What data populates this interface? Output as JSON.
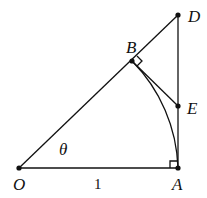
{
  "diagram": {
    "points": {
      "O": {
        "label": "O",
        "x": 19,
        "y": 168
      },
      "A": {
        "label": "A",
        "x": 178,
        "y": 168
      },
      "B": {
        "label": "B",
        "x": 132,
        "y": 61
      },
      "D": {
        "label": "D",
        "x": 178,
        "y": 15
      },
      "E": {
        "label": "E",
        "x": 178,
        "y": 106
      }
    },
    "angle_label": "θ",
    "side_label": "1",
    "right_angles": [
      "A",
      "B"
    ],
    "colors": {
      "stroke": "#111111",
      "background": "#ffffff"
    }
  }
}
